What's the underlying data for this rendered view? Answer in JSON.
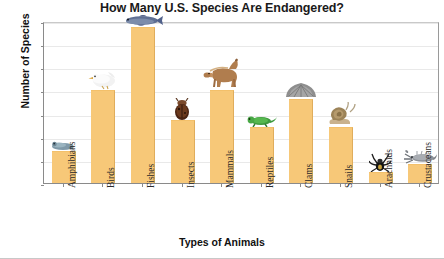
{
  "chart_data": {
    "type": "bar",
    "title": "How Many U.S. Species Are Endangered?",
    "xlabel": "Types of Animals",
    "ylabel": "Number of Species",
    "categories": [
      "Amphibians",
      "Birds",
      "Fishes",
      "Insects",
      "Mammals",
      "Reptiles",
      "Clams",
      "Snails",
      "Arachnids",
      "Crustaceans"
    ],
    "values": [
      35,
      100,
      168,
      68,
      100,
      60,
      91,
      60,
      12,
      21
    ],
    "ylim": [
      0,
      175
    ],
    "yticks": [
      0,
      25,
      50,
      75,
      100,
      125,
      150,
      175
    ],
    "ytick_labels": [
      "0",
      "25",
      "50",
      "75",
      "100",
      "125",
      "150",
      "175"
    ],
    "grid": true,
    "legend": "none",
    "bar_color": "#F7C878",
    "bar_edge_color": "#E0AD5C",
    "gridline_color": "#E9E9E9",
    "axis_color": "#8A8A8A",
    "background": "#FFFFFF",
    "icons": [
      {
        "category": "Amphibians",
        "name": "frog-icon"
      },
      {
        "category": "Birds",
        "name": "seagull-icon"
      },
      {
        "category": "Fishes",
        "name": "fish-icon"
      },
      {
        "category": "Insects",
        "name": "beetle-icon"
      },
      {
        "category": "Mammals",
        "name": "horse-icon"
      },
      {
        "category": "Reptiles",
        "name": "lizard-icon"
      },
      {
        "category": "Clams",
        "name": "clam-icon"
      },
      {
        "category": "Snails",
        "name": "snail-icon"
      },
      {
        "category": "Arachnids",
        "name": "spider-icon"
      },
      {
        "category": "Crustaceans",
        "name": "crayfish-icon"
      }
    ]
  }
}
